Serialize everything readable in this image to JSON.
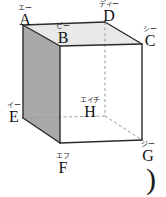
{
  "figure": {
    "name": "cube-diagram",
    "type": "geometry-solid",
    "shape": "cube",
    "colors": {
      "top_face": "#e9e9e9",
      "left_face": "#a9a9a9",
      "front_face": "#ffffff",
      "edge": "#2b2b2b",
      "hidden_edge": "#9a9a9a",
      "text": "#111111"
    },
    "vertices": [
      {
        "id": "A",
        "label": "A",
        "reading": "エー",
        "x": 23,
        "y": 25,
        "label_x": 12,
        "label_y": 4,
        "hidden": false
      },
      {
        "id": "B",
        "label": "B",
        "reading": "ビー",
        "x": 60,
        "y": 46,
        "label_x": 50,
        "label_y": 22,
        "hidden": false
      },
      {
        "id": "C",
        "label": "C",
        "reading": "シー",
        "x": 142,
        "y": 44,
        "label_x": 137,
        "label_y": 25,
        "hidden": false
      },
      {
        "id": "D",
        "label": "D",
        "reading": "ディー",
        "x": 105,
        "y": 22,
        "label_x": 96,
        "label_y": 0,
        "hidden": false
      },
      {
        "id": "E",
        "label": "E",
        "reading": "イー",
        "x": 23,
        "y": 118,
        "label_x": 1,
        "label_y": 101,
        "hidden": false
      },
      {
        "id": "F",
        "label": "F",
        "reading": "エフ",
        "x": 60,
        "y": 143,
        "label_x": 50,
        "label_y": 152,
        "hidden": false
      },
      {
        "id": "G",
        "label": "G",
        "reading": "ジー",
        "x": 142,
        "y": 140,
        "label_x": 135,
        "label_y": 140,
        "hidden": false
      },
      {
        "id": "H",
        "label": "H",
        "reading": "エイチ",
        "x": 105,
        "y": 116,
        "label_x": 73,
        "label_y": 96,
        "hidden": true
      }
    ],
    "faces": [
      {
        "id": "top",
        "name": "top-face",
        "vertices": "A B C D",
        "fill": "#e9e9e9"
      },
      {
        "id": "left",
        "name": "left-face",
        "vertices": "A B F E",
        "fill": "#a9a9a9"
      },
      {
        "id": "front",
        "name": "front-face",
        "vertices": "B C G F",
        "fill": "#ffffff"
      }
    ],
    "solid_edges": [
      {
        "from": "A",
        "to": "B"
      },
      {
        "from": "B",
        "to": "C"
      },
      {
        "from": "C",
        "to": "D"
      },
      {
        "from": "D",
        "to": "A"
      },
      {
        "from": "A",
        "to": "E"
      },
      {
        "from": "B",
        "to": "F"
      },
      {
        "from": "C",
        "to": "G"
      },
      {
        "from": "E",
        "to": "F"
      },
      {
        "from": "F",
        "to": "G"
      }
    ],
    "hidden_edges": [
      {
        "from": "D",
        "to": "H"
      },
      {
        "from": "H",
        "to": "E"
      },
      {
        "from": "H",
        "to": "G"
      }
    ],
    "paren_mark": ")"
  }
}
